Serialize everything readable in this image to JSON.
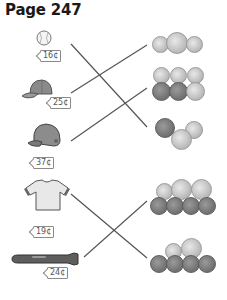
{
  "title": "Page 247",
  "items": [
    {
      "name": "baseball",
      "price": "16¢"
    },
    {
      "name": "baseball-cap",
      "price": "25¢"
    },
    {
      "name": "batting-helmet",
      "price": "37¢"
    },
    {
      "name": "t-shirt",
      "price": "19¢"
    },
    {
      "name": "baseball-bat",
      "price": "24¢"
    }
  ],
  "coin_groups": [
    {
      "coins": [
        "dime",
        "quarter-size nickel",
        "dime"
      ],
      "matched_item": "baseball-cap"
    },
    {
      "coins": [
        "dime",
        "dime",
        "dime",
        "penny",
        "penny",
        "nickel"
      ],
      "matched_item": "batting-helmet"
    },
    {
      "coins": [
        "penny",
        "nickel",
        "dime"
      ],
      "matched_item": "baseball"
    },
    {
      "coins": [
        "dime",
        "nickel",
        "nickel",
        "penny",
        "penny",
        "penny",
        "penny"
      ],
      "matched_item": "baseball-bat"
    },
    {
      "coins": [
        "dime",
        "nickel",
        "penny",
        "penny",
        "penny",
        "penny"
      ],
      "matched_item": "t-shirt"
    }
  ]
}
